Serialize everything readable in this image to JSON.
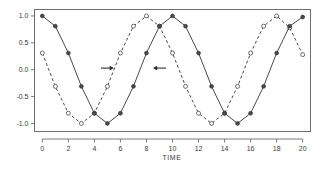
{
  "chart_data": {
    "type": "line",
    "title": "",
    "xlabel": "TIME",
    "ylabel": "",
    "xlim": [
      -0.6,
      20.6
    ],
    "ylim": [
      -1.15,
      1.12
    ],
    "xticks": [
      0,
      2,
      4,
      6,
      8,
      10,
      12,
      14,
      16,
      18,
      20
    ],
    "xtick_labels": [
      "0",
      "2",
      "4",
      "6",
      "8",
      "10",
      "12",
      "14",
      "16",
      "18",
      "20"
    ],
    "yticks": [
      1.0,
      0.5,
      0.0,
      -0.5,
      -1.0
    ],
    "ytick_labels": [
      "1.0",
      "0.5",
      "0.0",
      "-0.5",
      "-1.0"
    ],
    "grid": false,
    "legend": "none",
    "frame": true,
    "x": [
      0,
      1,
      2,
      3,
      4,
      5,
      6,
      7,
      8,
      9,
      10,
      11,
      12,
      13,
      14,
      15,
      16,
      17,
      18,
      19,
      20
    ],
    "series": [
      {
        "name": "solid-series",
        "style": "solid",
        "marker": "filled-circle",
        "color": "#4a4a4a",
        "values": [
          1.0,
          0.81,
          0.31,
          -0.31,
          -0.81,
          -1.0,
          -0.81,
          -0.31,
          0.31,
          0.81,
          1.0,
          0.81,
          0.31,
          -0.31,
          -0.81,
          -1.0,
          -0.81,
          -0.31,
          0.31,
          0.81,
          0.98
        ]
      },
      {
        "name": "dashed-series",
        "style": "dashed",
        "marker": "open-circle",
        "color": "#4a4a4a",
        "values": [
          0.31,
          -0.31,
          -0.81,
          -1.0,
          -0.81,
          -0.31,
          0.31,
          0.81,
          1.0,
          0.81,
          0.31,
          -0.31,
          -0.81,
          -1.0,
          -0.81,
          -0.31,
          0.31,
          0.81,
          1.0,
          0.78,
          0.28
        ]
      }
    ],
    "annotations": [
      {
        "name": "right-arrow",
        "glyph": "arrow-right",
        "x": 5.0,
        "y": 0.03,
        "direction": "right"
      },
      {
        "name": "left-arrow",
        "glyph": "arrow-left",
        "x": 9.0,
        "y": 0.03,
        "direction": "left"
      }
    ]
  }
}
